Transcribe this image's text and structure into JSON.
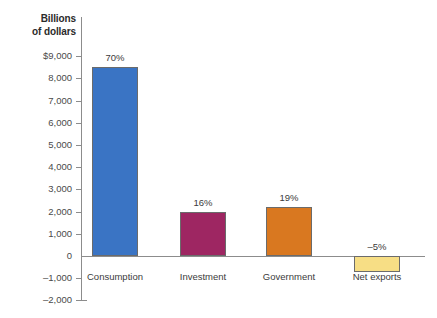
{
  "chart_data": {
    "type": "bar",
    "title": "",
    "subtitle": "",
    "axis_title": "Billions\nof dollars",
    "axis_title_line1": "Billions",
    "axis_title_line2": "of dollars",
    "xlabel": "",
    "ylabel": "Billions of dollars",
    "categories": [
      "Consumption",
      "Investment",
      "Government",
      "Net exports"
    ],
    "values": [
      8500,
      2000,
      2200,
      -700
    ],
    "data_labels": [
      "70%",
      "16%",
      "19%",
      "–5%"
    ],
    "percent_shares": [
      70,
      16,
      19,
      -5
    ],
    "colors": [
      "#3a74c4",
      "#9e2662",
      "#d97820",
      "#f7de85"
    ],
    "ylim": [
      -2000,
      9000
    ],
    "ytick_values": [
      9000,
      8000,
      7000,
      6000,
      5000,
      4000,
      3000,
      2000,
      1000,
      0,
      -1000,
      -2000
    ],
    "ytick_labels": [
      "$9,000",
      "8,000",
      "7,000",
      "6,000",
      "5,000",
      "4,000",
      "3,000",
      "2,000",
      "1,000",
      "0",
      "–1,000",
      "–2,000"
    ],
    "grid": false,
    "legend": false,
    "legend_position": "none"
  },
  "colors": {
    "axis": "#8c8c8c",
    "text": "#3b3b3b",
    "title_text": "#2b2b2b",
    "bar_outline": "#6b6b6b",
    "background": "#ffffff"
  }
}
